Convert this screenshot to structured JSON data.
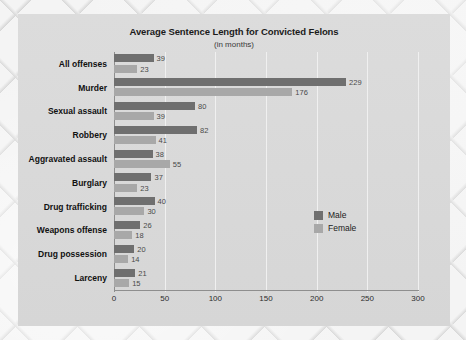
{
  "chart_data": {
    "type": "bar",
    "orientation": "horizontal",
    "title": "Average Sentence Length for Convicted Felons",
    "subtitle": "(in months)",
    "xlabel": "",
    "ylabel": "",
    "xlim": [
      0,
      300
    ],
    "xticks": [
      "0",
      "50",
      "100",
      "150",
      "200",
      "250",
      "300"
    ],
    "grid": true,
    "legend_position": "right-middle",
    "categories": [
      "All offenses",
      "Murder",
      "Sexual assault",
      "Robbery",
      "Aggravated assault",
      "Burglary",
      "Drug trafficking",
      "Weapons offense",
      "Drug possession",
      "Larceny"
    ],
    "series": [
      {
        "name": "Male",
        "color": "#6f6f6f",
        "values": [
          39,
          229,
          80,
          82,
          38,
          37,
          40,
          26,
          20,
          21
        ]
      },
      {
        "name": "Female",
        "color": "#a8a8a8",
        "values": [
          23,
          176,
          39,
          41,
          55,
          23,
          30,
          18,
          14,
          15
        ]
      }
    ]
  },
  "colors": {
    "male": "#6f6f6f",
    "female": "#a8a8a8",
    "panel": "#d8d8d8",
    "gridline": "#f0f0f0",
    "axis": "#8e8e8e",
    "text": "#1b1b1b"
  }
}
